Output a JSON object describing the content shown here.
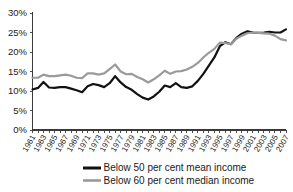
{
  "chart_data": {
    "type": "line",
    "title": "",
    "subtitle": "",
    "xlabel": "",
    "ylabel": "",
    "grid": false,
    "legend_position": "bottom",
    "ylim": [
      0,
      30
    ],
    "yticks": [
      0,
      5,
      10,
      15,
      20,
      25,
      30
    ],
    "ytick_labels": [
      "0%",
      "5%",
      "10%",
      "15%",
      "20%",
      "25%",
      "30%"
    ],
    "xlim": [
      1961,
      2007
    ],
    "x": [
      1961,
      1962,
      1963,
      1964,
      1965,
      1966,
      1967,
      1968,
      1969,
      1970,
      1971,
      1972,
      1973,
      1974,
      1975,
      1976,
      1977,
      1978,
      1979,
      1980,
      1981,
      1982,
      1983,
      1984,
      1985,
      1986,
      1987,
      1988,
      1989,
      1990,
      1991,
      1992,
      1993,
      1994,
      1995,
      1996,
      1997,
      1998,
      1999,
      2000,
      2001,
      2002,
      2003,
      2004,
      2005,
      2006,
      2007
    ],
    "xtick_labels": [
      "1961",
      "1963",
      "1965",
      "1967",
      "1969",
      "1971",
      "1973",
      "1975",
      "1977",
      "1979",
      "1981",
      "1983",
      "1985",
      "1987",
      "1989",
      "1991",
      "1993",
      "1995",
      "1997",
      "1999",
      "2001",
      "2003",
      "2005",
      "2007"
    ],
    "xticks": [
      1961,
      1963,
      1965,
      1967,
      1969,
      1971,
      1973,
      1975,
      1977,
      1979,
      1981,
      1983,
      1985,
      1987,
      1989,
      1991,
      1993,
      1995,
      1997,
      1999,
      2001,
      2003,
      2005,
      2007
    ],
    "series": [
      {
        "name": "Below 50 per cent mean income",
        "color": "#111111",
        "width": 2.2,
        "values": [
          10.4,
          10.8,
          12.3,
          10.9,
          10.8,
          11.0,
          11.0,
          10.6,
          10.2,
          9.7,
          11.2,
          11.8,
          11.5,
          11.0,
          12.0,
          13.8,
          12.2,
          11.0,
          10.3,
          9.2,
          8.3,
          7.8,
          8.6,
          9.8,
          11.4,
          11.0,
          12.0,
          11.0,
          10.8,
          11.2,
          12.6,
          14.4,
          16.5,
          18.6,
          21.5,
          22.5,
          22.0,
          23.6,
          24.7,
          25.3,
          25.0,
          24.9,
          25.0,
          25.2,
          25.0,
          25.0,
          25.8
        ],
        "values_note": "black series, per cent of population below 50 per cent of mean income"
      },
      {
        "name": "Below 60 per cent median income",
        "color": "#9a9a9a",
        "width": 2.2,
        "values": [
          13.4,
          13.4,
          14.2,
          13.8,
          13.8,
          14.0,
          14.2,
          13.9,
          13.4,
          13.3,
          14.5,
          14.5,
          14.2,
          14.5,
          15.6,
          16.8,
          15.0,
          14.3,
          14.4,
          13.6,
          13.0,
          12.2,
          13.0,
          14.0,
          15.2,
          14.4,
          15.0,
          15.1,
          15.5,
          16.2,
          17.2,
          18.6,
          19.8,
          20.8,
          22.4,
          22.3,
          22.0,
          23.4,
          24.2,
          24.8,
          25.0,
          24.9,
          24.8,
          24.7,
          24.2,
          23.3,
          23.0
        ],
        "values_note": "grey series, per cent of population below 60 per cent of median income"
      }
    ],
    "legend": [
      {
        "label": "Below 50 per cent mean income",
        "color": "#111111"
      },
      {
        "label": "Below 60 per cent median income",
        "color": "#9a9a9a"
      }
    ]
  }
}
